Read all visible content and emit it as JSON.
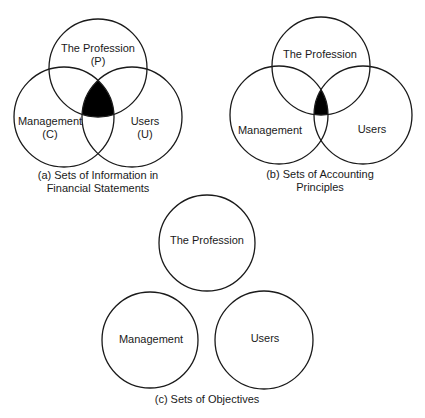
{
  "diagrams": {
    "a": {
      "caption_line1": "(a) Sets of Information in",
      "caption_line2": "Financial Statements",
      "top_label": "The Profession",
      "top_sub": "(P)",
      "left_label": "Management",
      "left_sub": "(C)",
      "right_label": "Users",
      "right_sub": "(U)"
    },
    "b": {
      "caption_line1": "(b) Sets of Accounting",
      "caption_line2": "Principles",
      "top_label": "The Profession",
      "left_label": "Management",
      "right_label": "Users"
    },
    "c": {
      "caption": "(c) Sets of Objectives",
      "top_label": "The Profession",
      "left_label": "Management",
      "right_label": "Users"
    }
  },
  "colors": {
    "stroke": "#1a1a1a",
    "intersection_fill": "#000000",
    "background": "#ffffff"
  }
}
